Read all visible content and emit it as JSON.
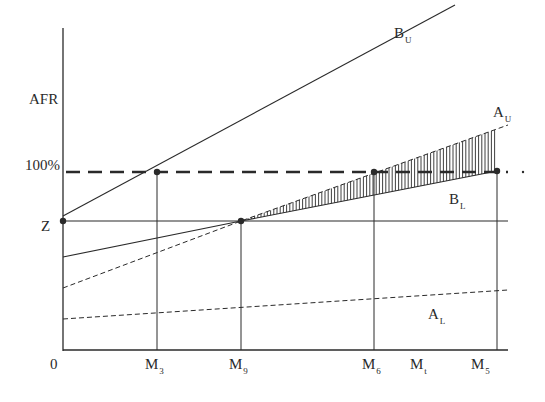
{
  "chart_data": {
    "type": "line",
    "title": "",
    "ylabel": "AFR",
    "xlabel": "",
    "y_ticks": [
      {
        "label": "100%",
        "y": 172
      },
      {
        "label": "Z",
        "y": 221
      }
    ],
    "x_ticks": [
      {
        "label": "0",
        "sub": "",
        "x": 55
      },
      {
        "label": "M",
        "sub": "3",
        "x": 157
      },
      {
        "label": "M",
        "sub": "9",
        "x": 241
      },
      {
        "label": "M",
        "sub": "6",
        "x": 374
      },
      {
        "label": "M",
        "sub": "t",
        "x": 420
      },
      {
        "label": "M",
        "sub": "5",
        "x": 497
      }
    ],
    "series": [
      {
        "name": "B_U",
        "label": "B",
        "sub": "U",
        "style": "solid",
        "points": [
          [
            63,
            216
          ],
          [
            455,
            5
          ]
        ]
      },
      {
        "name": "B_L",
        "label": "B",
        "sub": "L",
        "style": "solid",
        "points": [
          [
            63,
            257
          ],
          [
            241,
            221
          ],
          [
            497,
            171
          ]
        ]
      },
      {
        "name": "A_U",
        "label": "A",
        "sub": "U",
        "style": "dashed",
        "points": [
          [
            63,
            288
          ],
          [
            241,
            221
          ],
          [
            508,
            125
          ]
        ]
      },
      {
        "name": "A_L",
        "label": "A",
        "sub": "L",
        "style": "dashed",
        "points": [
          [
            63,
            319
          ],
          [
            508,
            290
          ]
        ]
      }
    ],
    "reference_lines": [
      {
        "name": "100% threshold",
        "style": "heavy-dashed",
        "y": 172
      },
      {
        "name": "Z level",
        "style": "solid",
        "y": 221
      }
    ],
    "markers": [
      {
        "name": "Z point",
        "x": 63,
        "y": 221
      },
      {
        "name": "B_U meets 100% at M3",
        "x": 157,
        "y": 172
      },
      {
        "name": "B_L and A_U cross Z at M9",
        "x": 241,
        "y": 221
      },
      {
        "name": "A_U meets 100% at M6",
        "x": 374,
        "y": 172
      },
      {
        "name": "B_L meets 100% at M5",
        "x": 497,
        "y": 171
      }
    ],
    "shaded_region": {
      "between": [
        "A_U",
        "B_L"
      ],
      "from_x": 241,
      "to_x": 497,
      "pattern": "vertical-hatch"
    },
    "grid": false,
    "legend": "inline labels"
  },
  "labels": {
    "y_axis": "AFR",
    "hundred_pct": "100%",
    "z": "Z",
    "origin": "0",
    "b_u": {
      "main": "B",
      "sub": "U"
    },
    "a_u": {
      "main": "A",
      "sub": "U"
    },
    "b_l": {
      "main": "B",
      "sub": "L"
    },
    "a_l": {
      "main": "A",
      "sub": "L"
    },
    "m3": {
      "main": "M",
      "sub": "3"
    },
    "m9": {
      "main": "M",
      "sub": "9"
    },
    "m6": {
      "main": "M",
      "sub": "6"
    },
    "mt": {
      "main": "M",
      "sub": "t"
    },
    "m5": {
      "main": "M",
      "sub": "5"
    }
  },
  "colors": {
    "ink": "#2a2a2a",
    "background": "#ffffff"
  }
}
